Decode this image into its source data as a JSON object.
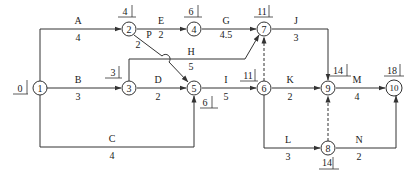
{
  "diagram": {
    "type": "activity-on-arrow network",
    "nodes": [
      {
        "id": "1",
        "label": "1",
        "x": 40,
        "y": 88,
        "time": "0"
      },
      {
        "id": "2",
        "label": "2",
        "x": 129,
        "y": 29,
        "time": "4"
      },
      {
        "id": "3",
        "label": "3",
        "x": 129,
        "y": 88,
        "time": "3"
      },
      {
        "id": "4",
        "label": "4",
        "x": 194,
        "y": 29,
        "time": "6"
      },
      {
        "id": "5",
        "label": "5",
        "x": 194,
        "y": 88,
        "time": "6"
      },
      {
        "id": "6",
        "label": "6",
        "x": 264,
        "y": 88,
        "time": "11"
      },
      {
        "id": "7",
        "label": "7",
        "x": 264,
        "y": 29,
        "time": "11"
      },
      {
        "id": "8",
        "label": "8",
        "x": 328,
        "y": 148,
        "time": "14"
      },
      {
        "id": "9",
        "label": "9",
        "x": 328,
        "y": 88,
        "time": "14"
      },
      {
        "id": "10",
        "label": "10",
        "x": 394,
        "y": 88,
        "time": "18"
      }
    ],
    "activities": [
      {
        "name": "A",
        "duration": "4",
        "from": "1",
        "to": "2"
      },
      {
        "name": "B",
        "duration": "3",
        "from": "1",
        "to": "3"
      },
      {
        "name": "C",
        "duration": "4",
        "from": "1",
        "to": "5"
      },
      {
        "name": "P",
        "duration": "2",
        "from": "2",
        "to": "5"
      },
      {
        "name": "E",
        "duration": "2",
        "from": "2",
        "to": "4"
      },
      {
        "name": "G",
        "duration": "4.5",
        "from": "4",
        "to": "7"
      },
      {
        "name": "H",
        "duration": "5",
        "from": "3",
        "to": "7"
      },
      {
        "name": "D",
        "duration": "2",
        "from": "3",
        "to": "5"
      },
      {
        "name": "I",
        "duration": "5",
        "from": "5",
        "to": "6"
      },
      {
        "name": "J",
        "duration": "3",
        "from": "7",
        "to": "9"
      },
      {
        "name": "K",
        "duration": "2",
        "from": "6",
        "to": "9"
      },
      {
        "name": "L",
        "duration": "3",
        "from": "6",
        "to": "8"
      },
      {
        "name": "M",
        "duration": "4",
        "from": "9",
        "to": "10"
      },
      {
        "name": "N",
        "duration": "2",
        "from": "8",
        "to": "10"
      }
    ],
    "dummies": [
      {
        "from": "6",
        "to": "7"
      },
      {
        "from": "8",
        "to": "9"
      }
    ]
  },
  "labels": {
    "A": {
      "name": "A",
      "dur": "4"
    },
    "B": {
      "name": "B",
      "dur": "3"
    },
    "C": {
      "name": "C",
      "dur": "4"
    },
    "P": {
      "name": "P",
      "dur": "2"
    },
    "E": {
      "name": "E",
      "dur": "2"
    },
    "G": {
      "name": "G",
      "dur": "4.5"
    },
    "H": {
      "name": "H",
      "dur": "5"
    },
    "D": {
      "name": "D",
      "dur": "2"
    },
    "I": {
      "name": "I",
      "dur": "5"
    },
    "J": {
      "name": "J",
      "dur": "3"
    },
    "K": {
      "name": "K",
      "dur": "2"
    },
    "L": {
      "name": "L",
      "dur": "3"
    },
    "M": {
      "name": "M",
      "dur": "4"
    },
    "N": {
      "name": "N",
      "dur": "2"
    }
  },
  "node_labels": {
    "n1": "1",
    "n2": "2",
    "n3": "3",
    "n4": "4",
    "n5": "5",
    "n6": "6",
    "n7": "7",
    "n8": "8",
    "n9": "9",
    "n10": "10"
  },
  "times": {
    "n1": "0",
    "n2": "4",
    "n3": "3",
    "n4": "6",
    "n5": "6",
    "n6": "11",
    "n7": "11",
    "n8": "14",
    "n9": "14",
    "n10": "18"
  }
}
